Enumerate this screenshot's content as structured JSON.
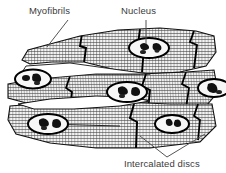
{
  "figure": {
    "background_color": "#ffffff",
    "ink_color": "#1a1a1a",
    "text_color": "#3b3b3b",
    "shading_color": "#8a8a8a"
  },
  "labels": {
    "myofibrils": "Myofibrils",
    "nucleus": "Nucleus",
    "intercalated_discs": "Intercalated discs"
  },
  "leaders": {
    "myofibrils": "diagonal-line-down-left",
    "nucleus": "vertical-line-down",
    "intercalated_discs": "v-shaped-double-line-up"
  },
  "structures": {
    "nuclei_count": 6,
    "intercalated_disc_count": 8,
    "fiber_band_count": 3,
    "striation_pattern": "cross-hatched-horizontal-and-vertical"
  }
}
